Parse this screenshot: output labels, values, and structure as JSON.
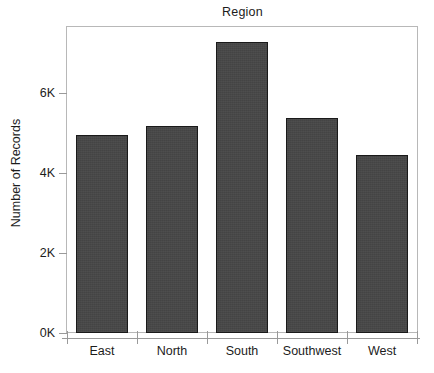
{
  "chart_data": {
    "type": "bar",
    "title": "Region",
    "xlabel": "",
    "ylabel": "Number of Records",
    "categories": [
      "East",
      "North",
      "South",
      "Southwest",
      "West"
    ],
    "values": [
      4950,
      5170,
      7290,
      5370,
      4445
    ],
    "series": [
      {
        "name": "Number of Records",
        "values": [
          4950,
          5170,
          7290,
          5370,
          4445
        ]
      }
    ],
    "ylim": [
      0,
      7660
    ],
    "ytick_values": [
      0,
      2000,
      4000,
      6000
    ],
    "ytick_labels": [
      "0K",
      "2K",
      "4K",
      "6K"
    ],
    "grid": false,
    "legend": null,
    "legend_position": "none",
    "bar_color": "#474747",
    "bar_edge_color": "#1a1a1a",
    "axis_color": "#9a9a9a",
    "frame_color": "#b8b8b8",
    "text_color": "#1c1c1c",
    "background": "#ffffff"
  },
  "axis": {
    "y_title": "Number of Records",
    "ticks": [
      {
        "label": "6K",
        "value": 6000
      },
      {
        "label": "4K",
        "value": 4000
      },
      {
        "label": "2K",
        "value": 2000
      },
      {
        "label": "0K",
        "value": 0
      }
    ]
  },
  "bars": [
    {
      "label": "East",
      "value": 4950
    },
    {
      "label": "North",
      "value": 5170
    },
    {
      "label": "South",
      "value": 7290
    },
    {
      "label": "Southwest",
      "value": 5370
    },
    {
      "label": "West",
      "value": 4445
    }
  ]
}
